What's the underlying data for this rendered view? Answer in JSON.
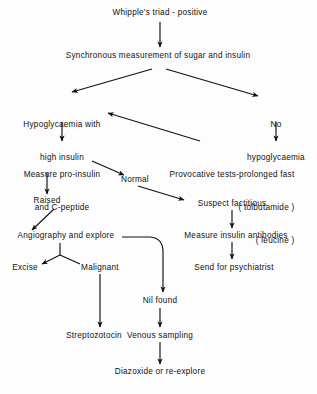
{
  "diagram": {
    "title": "Whipple's triad - positive",
    "type": "clinical-flowchart",
    "background_color": "#fdfdfd",
    "text_color": "#111111",
    "nodes": [
      {
        "id": "whipple",
        "label": "Whipple's triad - positive",
        "x": 160,
        "y": 14
      },
      {
        "id": "synchronous",
        "label": "Synchronous measurement of sugar and insulin",
        "x": 158,
        "y": 57
      },
      {
        "id": "hypo_high",
        "line1": "Hypoglycaemia with",
        "line2": "high insulin",
        "x": 62,
        "y": 98
      },
      {
        "id": "no_hypo",
        "line1": "No",
        "line2": "hypoglycaemia",
        "x": 276,
        "y": 98
      },
      {
        "id": "measure_pro",
        "line1": "Measure pro-insulin",
        "line2": "and C-peptide",
        "x": 62,
        "y": 148
      },
      {
        "id": "provocative",
        "line1": "Provocative tests-prolonged fast",
        "line2": "( tolbutamide )",
        "line3": "( leucine )",
        "x": 232,
        "y": 148
      },
      {
        "id": "normal",
        "label": "Normal",
        "x": 135,
        "y": 180
      },
      {
        "id": "raised",
        "label": "Raised",
        "x": 47,
        "y": 200
      },
      {
        "id": "suspect",
        "label": "Suspect factitious",
        "x": 232,
        "y": 203
      },
      {
        "id": "angiography",
        "label": "Angiography and explore",
        "x": 66,
        "y": 235
      },
      {
        "id": "measure_anti",
        "label": "Measure insulin antibodies",
        "x": 236,
        "y": 235
      },
      {
        "id": "excise",
        "label": "Excise",
        "x": 25,
        "y": 266
      },
      {
        "id": "malignant",
        "label": "Malignant",
        "x": 100,
        "y": 266
      },
      {
        "id": "send_psych",
        "label": "Send for psychiatrist",
        "x": 234,
        "y": 266
      },
      {
        "id": "nil_found",
        "label": "Nil found",
        "x": 160,
        "y": 300
      },
      {
        "id": "streptozotocin",
        "label": "Streptozotocin",
        "x": 94,
        "y": 334
      },
      {
        "id": "venous",
        "label": "Venous sampling",
        "x": 160,
        "y": 334
      },
      {
        "id": "diazoxide",
        "label": "Diazoxide or re-explore",
        "x": 160,
        "y": 371
      }
    ],
    "edges": [
      {
        "from": "whipple",
        "to": "synchronous",
        "kind": "vertical"
      },
      {
        "from": "synchronous",
        "to": "hypo_high",
        "kind": "diagonal-left"
      },
      {
        "from": "synchronous",
        "to": "no_hypo",
        "kind": "diagonal-right"
      },
      {
        "from": "hypo_high",
        "to": "measure_pro",
        "kind": "vertical"
      },
      {
        "from": "no_hypo",
        "to": "provocative",
        "kind": "vertical"
      },
      {
        "from": "provocative",
        "to": "hypo_high",
        "kind": "diagonal-up-left"
      },
      {
        "from": "measure_pro",
        "to": "raised",
        "kind": "vertical"
      },
      {
        "from": "measure_pro",
        "to": "normal",
        "kind": "diagonal-right"
      },
      {
        "from": "normal",
        "to": "suspect",
        "kind": "diagonal-right"
      },
      {
        "from": "raised",
        "to": "angiography",
        "kind": "diagonal-left"
      },
      {
        "from": "suspect",
        "to": "measure_anti",
        "kind": "vertical"
      },
      {
        "from": "measure_anti",
        "to": "send_psych",
        "kind": "vertical"
      },
      {
        "from": "angiography",
        "to": "excise",
        "kind": "branch-left"
      },
      {
        "from": "angiography",
        "to": "malignant",
        "kind": "branch-right"
      },
      {
        "from": "angiography",
        "to": "nil_found",
        "kind": "curve"
      },
      {
        "from": "malignant",
        "to": "streptozotocin",
        "kind": "vertical"
      },
      {
        "from": "nil_found",
        "to": "venous",
        "kind": "vertical"
      },
      {
        "from": "venous",
        "to": "diazoxide",
        "kind": "vertical"
      }
    ]
  }
}
